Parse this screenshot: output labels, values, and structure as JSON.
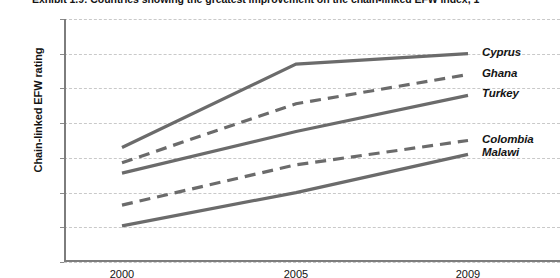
{
  "chart_data": {
    "type": "line",
    "title": "Exhibit 1.9: Countries showing the greatest improvement on the chain-linked EFW index, 1",
    "xlabel": "",
    "ylabel": "Chain-linked EFW rating",
    "categories": [
      "2000",
      "2005",
      "2009"
    ],
    "x": [
      2000,
      2005,
      2009
    ],
    "ylim": [
      4.5,
      8.0
    ],
    "ytick_step": 0.5,
    "yticks": [
      "8.0",
      "7.5",
      "7.0",
      "6.5",
      "6.0",
      "5.5",
      "5.0",
      "4.5"
    ],
    "grid": true,
    "legend_position": "right-inline-labels",
    "line_color": "#6b6b6b",
    "grid_color": "#c9c9c9",
    "axis_color": "#7d7d7d",
    "series": [
      {
        "name": "Cyprus",
        "values": [
          6.15,
          7.35,
          7.5
        ],
        "style": "solid"
      },
      {
        "name": "Ghana",
        "values": [
          5.93,
          6.78,
          7.2
        ],
        "style": "dashed"
      },
      {
        "name": "Turkey",
        "values": [
          5.78,
          6.38,
          6.9
        ],
        "style": "solid"
      },
      {
        "name": "Colombia",
        "values": [
          5.32,
          5.9,
          6.25
        ],
        "style": "dashed"
      },
      {
        "name": "Malawi",
        "values": [
          5.02,
          5.5,
          6.05
        ],
        "style": "solid"
      }
    ]
  }
}
